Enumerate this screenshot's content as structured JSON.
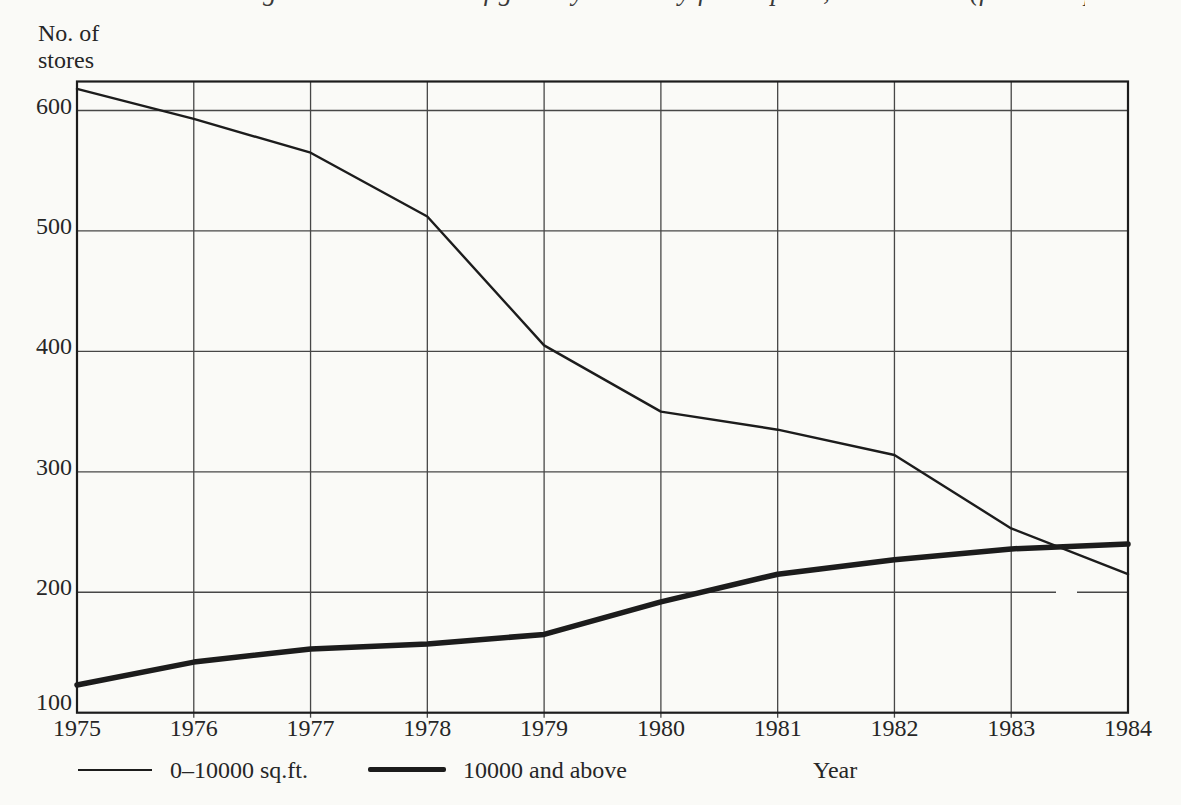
{
  "page": {
    "cropped_caption_fragment": "Changes in the number of grocery stores by floor space, 1975–1984 (from company reports)"
  },
  "chart_data": {
    "type": "line",
    "title": "",
    "ylabel_lines": [
      "No. of",
      "stores"
    ],
    "xlabel": "Year",
    "x": [
      1975,
      1976,
      1977,
      1978,
      1979,
      1980,
      1981,
      1982,
      1983,
      1984
    ],
    "yticks": [
      100,
      200,
      300,
      400,
      500,
      600
    ],
    "ylim": [
      100,
      625
    ],
    "grid": true,
    "legend_position": "bottom",
    "series": [
      {
        "name": "0–10000 sq.ft.",
        "line_weight": "thin",
        "values": [
          618,
          593,
          565,
          512,
          405,
          350,
          335,
          314,
          253,
          215
        ]
      },
      {
        "name": "10000 and above",
        "line_weight": "thick",
        "values": [
          123,
          142,
          153,
          157,
          165,
          192,
          215,
          227,
          236,
          240
        ]
      }
    ]
  },
  "colors": {
    "paper": "#fafaf7",
    "ink": "#1c1c1c",
    "grid": "#474747",
    "text": "#262626"
  }
}
